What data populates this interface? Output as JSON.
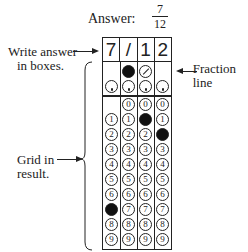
{
  "answer": {
    "label": "Answer:",
    "numerator": "7",
    "denominator": "12"
  },
  "grid": {
    "boxes": [
      "7",
      "/",
      "1",
      "2"
    ],
    "fraction_row": [
      null,
      "filled",
      "slash",
      null
    ],
    "decimal_row": [
      "dot",
      "dot",
      "dot",
      "dot"
    ],
    "digits": [
      "0",
      "1",
      "2",
      "3",
      "4",
      "5",
      "6",
      "7",
      "8",
      "9"
    ],
    "filled": {
      "col0": "7",
      "col2": "1",
      "col3": "2"
    }
  },
  "annotations": {
    "write_answer": [
      "Write answer",
      "in boxes."
    ],
    "fraction_line": [
      "Fraction",
      "line"
    ],
    "grid_in": [
      "Grid in",
      "result."
    ]
  }
}
